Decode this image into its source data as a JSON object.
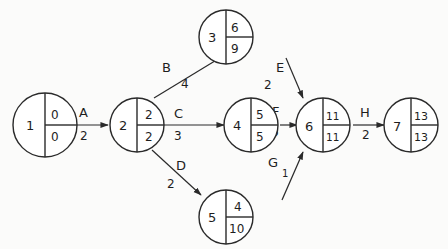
{
  "diagram": {
    "type": "activity-on-arrow network",
    "nodes": [
      {
        "id": "1",
        "earliest": "0",
        "latest": "0",
        "cx": 45,
        "cy": 125,
        "r": 32
      },
      {
        "id": "2",
        "earliest": "2",
        "latest": "2",
        "cx": 137,
        "cy": 125,
        "r": 27
      },
      {
        "id": "3",
        "earliest": "6",
        "latest": "9",
        "cx": 253,
        "cy": 37,
        "r": 27
      },
      {
        "id": "4",
        "earliest": "5",
        "latest": "5",
        "cx": 253,
        "cy": 125,
        "r": 27
      },
      {
        "id": "5",
        "earliest": "4",
        "latest": "10",
        "cx": 253,
        "cy": 215,
        "r": 27
      },
      {
        "id": "6",
        "earliest": "11",
        "latest": "11",
        "cx": 326,
        "cy": 125,
        "r": 27
      },
      {
        "id": "7",
        "earliest": "13",
        "latest": "13",
        "cx": 413,
        "cy": 125,
        "r": 27
      }
    ],
    "edges": [
      {
        "activity": "A",
        "duration": "2",
        "from": "1",
        "to": "2"
      },
      {
        "activity": "B",
        "duration": "4",
        "from": "2",
        "to": "3"
      },
      {
        "activity": "C",
        "duration": "3",
        "from": "2",
        "to": "4"
      },
      {
        "activity": "D",
        "duration": "2",
        "from": "2",
        "to": "5"
      },
      {
        "activity": "E",
        "duration": "2",
        "from": "3",
        "to": "6"
      },
      {
        "activity": "F",
        "duration": "6",
        "from": "4",
        "to": "6"
      },
      {
        "activity": "G",
        "duration": "1",
        "from": "5",
        "to": "6"
      },
      {
        "activity": "H",
        "duration": "2",
        "from": "6",
        "to": "7"
      }
    ]
  },
  "colors": {
    "stroke": "#2a2a2a",
    "background": "#fbfbfa",
    "node_fill": "#ffffff"
  }
}
